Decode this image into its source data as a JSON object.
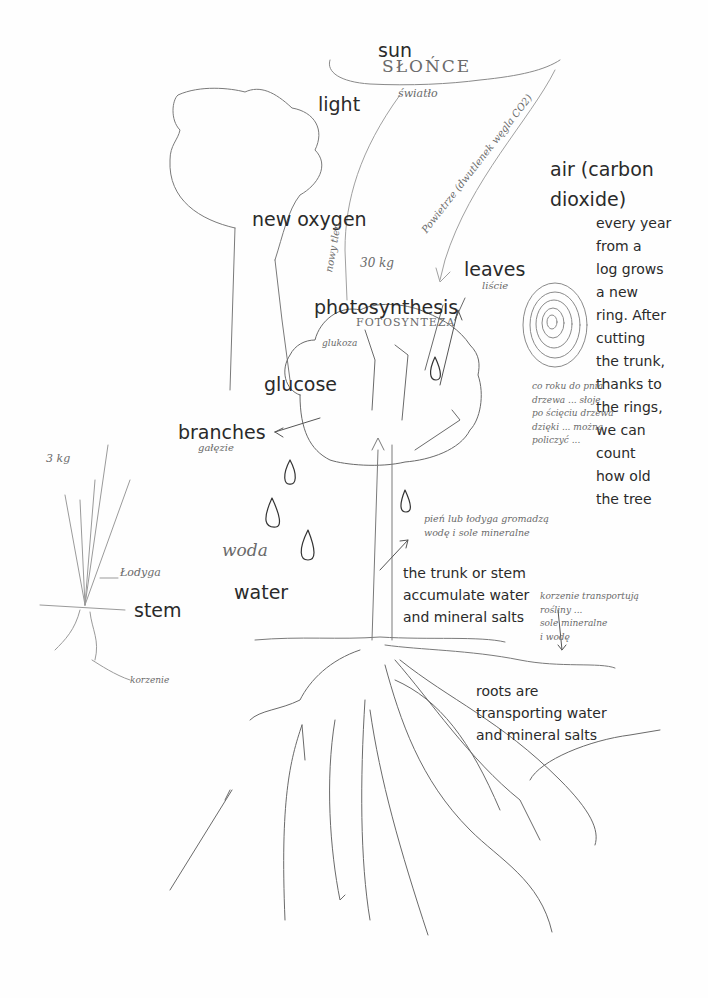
{
  "labels": {
    "sun": "sun",
    "light": "light",
    "air": "air (carbon\ndioxide)",
    "new_oxygen": "new oxygen",
    "leaves": "leaves",
    "photosynthesis": "photosynthesis",
    "glucose": "glucose",
    "branches": "branches",
    "water": "water",
    "stem": "stem",
    "tree_rings_note": "every year\nfrom a\nlog grows\na new\nring. After\ncutting\nthe trunk,\nthanks to\nthe rings,\nwe can\ncount\nhow old\nthe tree",
    "trunk_note": "the trunk or stem\naccumulate water\nand mineral salts",
    "roots_note": "roots are\ntransporting water\nand mineral salts"
  },
  "handwriting": {
    "slonce": "SŁOŃCE",
    "swiatlo": "światło",
    "powietrze": "Powietrze (dwutlenek węgla CO2)",
    "nowy_tlen": "nowy tlen",
    "weight_tree": "30 kg",
    "liscie": "liście",
    "fotosynteza": "FOTOSYNTEZA",
    "glukoza": "glukoza",
    "galezie": "gałęzie",
    "woda": "woda",
    "weight_plant": "3 kg",
    "lodyga": "Łodyga",
    "korzenie": "korzenie",
    "rings_pl": "co roku do pnia\ndrzewa ... słoje\npo ścięciu drzewa\ndzięki ... można\npoliczyć ...",
    "trunk_pl": "pień lub łodyga gromadzą\nwodę i sole mineralne",
    "roots_pl": "korzenie transportują\nrośliny ...\nsole mineralne\ni wodę"
  },
  "colors": {
    "label_text": "#2a2a2a",
    "pencil_dark": "#555555",
    "pencil_light": "#a8a8a8",
    "paper": "#fefefe"
  }
}
